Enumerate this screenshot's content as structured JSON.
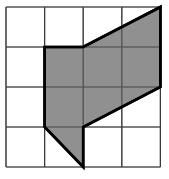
{
  "figure": {
    "grid": {
      "cols": 4,
      "rows": 4,
      "origin_px": [
        6,
        7
      ],
      "cell_px": [
        38.6,
        40
      ]
    },
    "colors": {
      "grid_line": "#3a3a3a",
      "shape_fill": "#7d7d7d",
      "shape_outline": "#000000",
      "background": "#ffffff"
    },
    "shape_vertices_grid": [
      [
        1,
        1
      ],
      [
        2,
        1
      ],
      [
        4,
        0
      ],
      [
        4,
        2
      ],
      [
        2,
        3
      ],
      [
        2,
        4
      ],
      [
        1,
        3
      ]
    ]
  }
}
